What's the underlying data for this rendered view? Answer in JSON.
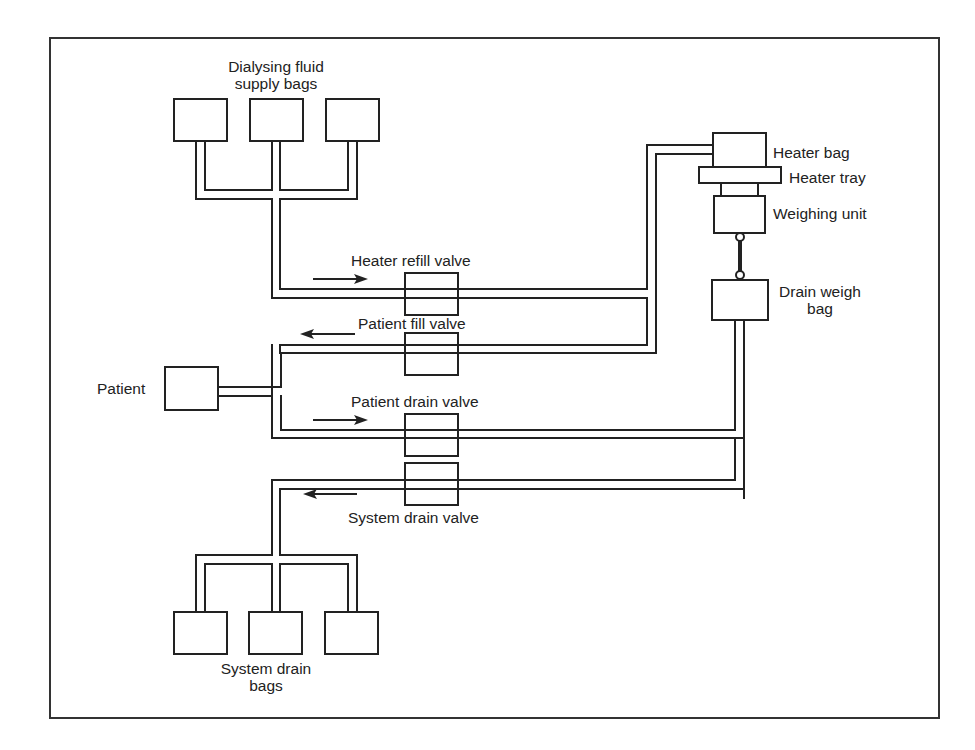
{
  "diagram": {
    "type": "schematic",
    "title": "",
    "stroke_color": "#222222",
    "background": "#ffffff"
  },
  "labels": {
    "supply_bags_line1": "Dialysing fluid",
    "supply_bags_line2": "supply bags",
    "heater_bag": "Heater bag",
    "heater_tray": "Heater tray",
    "weighing_unit": "Weighing unit",
    "drain_weigh_bag_line1": "Drain weigh",
    "drain_weigh_bag_line2": "bag",
    "heater_refill_valve": "Heater refill valve",
    "patient_fill_valve": "Patient fill valve",
    "patient": "Patient",
    "patient_drain_valve": "Patient drain valve",
    "system_drain_valve": "System drain valve",
    "system_drain_bags_line1": "System drain",
    "system_drain_bags_line2": "bags"
  },
  "components": [
    {
      "id": "supply-bag-1",
      "kind": "bag"
    },
    {
      "id": "supply-bag-2",
      "kind": "bag"
    },
    {
      "id": "supply-bag-3",
      "kind": "bag"
    },
    {
      "id": "heater-bag",
      "kind": "bag"
    },
    {
      "id": "heater-tray",
      "kind": "tray"
    },
    {
      "id": "weighing-unit",
      "kind": "scale"
    },
    {
      "id": "drain-weigh-bag",
      "kind": "bag"
    },
    {
      "id": "heater-refill-valve",
      "kind": "valve",
      "flow": "right"
    },
    {
      "id": "patient-fill-valve",
      "kind": "valve",
      "flow": "left"
    },
    {
      "id": "patient",
      "kind": "patient"
    },
    {
      "id": "patient-drain-valve",
      "kind": "valve",
      "flow": "right"
    },
    {
      "id": "system-drain-valve",
      "kind": "valve",
      "flow": "left"
    },
    {
      "id": "system-drain-bag-1",
      "kind": "bag"
    },
    {
      "id": "system-drain-bag-2",
      "kind": "bag"
    },
    {
      "id": "system-drain-bag-3",
      "kind": "bag"
    }
  ],
  "connections": [
    {
      "from": "supply bags",
      "to": "heater bag",
      "via": "heater refill valve"
    },
    {
      "from": "heater bag",
      "to": "patient",
      "via": "patient fill valve"
    },
    {
      "from": "patient",
      "to": "drain weigh bag",
      "via": "patient drain valve"
    },
    {
      "from": "drain weigh bag",
      "to": "system drain bags",
      "via": "system drain valve"
    }
  ]
}
